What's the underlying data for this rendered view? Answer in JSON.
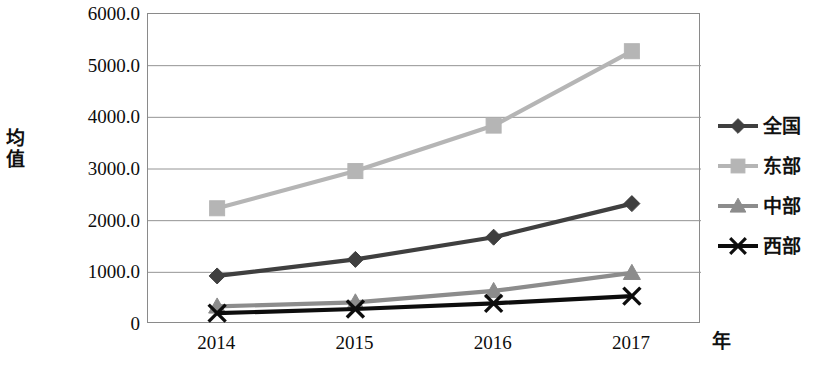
{
  "chart_data": {
    "type": "line",
    "title": "",
    "xlabel": "年",
    "ylabel": "均值",
    "categories": [
      "2014",
      "2015",
      "2016",
      "2017"
    ],
    "ylim": [
      0,
      6000
    ],
    "y_ticks": [
      "0",
      "1000.0",
      "2000.0",
      "3000.0",
      "4000.0",
      "5000.0",
      "6000.0"
    ],
    "y_tick_values": [
      0,
      1000,
      2000,
      3000,
      4000,
      5000,
      6000
    ],
    "grid": true,
    "legend_position": "right",
    "series": [
      {
        "name": "全国",
        "marker": "diamond",
        "color": "#3f3f3f",
        "values": [
          930,
          1250,
          1680,
          2330
        ]
      },
      {
        "name": "东部",
        "marker": "square",
        "color": "#b5b5b5",
        "values": [
          2240,
          2960,
          3840,
          5280
        ]
      },
      {
        "name": "中部",
        "marker": "triangle",
        "color": "#8c8c8c",
        "values": [
          340,
          420,
          640,
          990
        ]
      },
      {
        "name": "西部",
        "marker": "cross",
        "color": "#0d0d0d",
        "values": [
          210,
          290,
          400,
          540
        ]
      }
    ]
  },
  "axes": {
    "y_title": "均值",
    "x_title": "年"
  },
  "legend": {
    "items": [
      {
        "label": "全国"
      },
      {
        "label": "东部"
      },
      {
        "label": "中部"
      },
      {
        "label": "西部"
      }
    ]
  }
}
